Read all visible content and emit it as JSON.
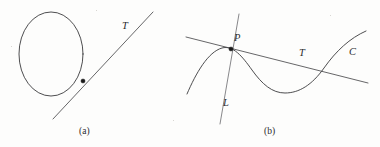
{
  "figure": {
    "background_color": "#fdfdfc",
    "ink_color": "#3a3a3c",
    "width": 380,
    "height": 147
  },
  "panel_a": {
    "caption": "(a)",
    "caption_pos": {
      "x": 79,
      "y": 127
    },
    "shapes": {
      "circle": {
        "name": "circle",
        "center_x": 51,
        "center_y": 54,
        "radius_x": 32,
        "radius_y": 42
      },
      "tangent_line": {
        "label": "T",
        "label_pos": {
          "x": 122,
          "y": 21
        },
        "x1": 53,
        "y1": 119,
        "x2": 153,
        "y2": 12
      },
      "tangency_point": {
        "name": "point-of-tangency",
        "x": 83,
        "y": 81,
        "radius": 2.1
      }
    }
  },
  "panel_b": {
    "caption": "(b)",
    "caption_pos": {
      "x": 264,
      "y": 127
    },
    "shapes": {
      "curve": {
        "label": "C",
        "label_pos": {
          "x": 349,
          "y": 47
        },
        "description": "cubic-like curve with local maximum at P and local minimum at right of center",
        "local_max": {
          "x": 224,
          "y": 48
        },
        "local_min": {
          "x": 290,
          "y": 93
        },
        "left_end": {
          "x": 187,
          "y": 94
        },
        "right_end": {
          "x": 366,
          "y": 31
        }
      },
      "tangent_line": {
        "label": "T",
        "label_pos": {
          "x": 299,
          "y": 48
        },
        "x1": 186,
        "y1": 37,
        "x2": 368,
        "y2": 83
      },
      "vertical_line": {
        "label": "L",
        "label_pos": {
          "x": 223,
          "y": 98
        },
        "x1": 239,
        "y1": 14,
        "x2": 220,
        "y2": 124
      },
      "tangency_point": {
        "name": "point-P",
        "label": "P",
        "label_pos": {
          "x": 234,
          "y": 33
        },
        "x": 231,
        "y": 49,
        "radius": 2.1
      },
      "secondary_crossing": {
        "name": "tangent-recrosses-curve",
        "x": 334,
        "y": 70
      }
    }
  }
}
